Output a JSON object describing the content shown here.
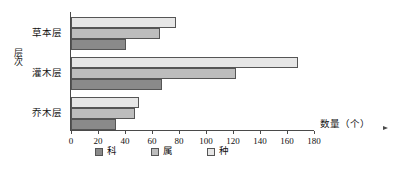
{
  "chart_data": {
    "type": "bar",
    "orientation": "horizontal",
    "title": "",
    "xlabel": "数量（个）",
    "ylabel": "层次",
    "xlim": [
      0,
      180
    ],
    "xticks": [
      0,
      20,
      40,
      60,
      80,
      100,
      120,
      140,
      160,
      180
    ],
    "grid": false,
    "legend_position": "bottom",
    "categories": [
      "乔木层",
      "灌木层",
      "草本层"
    ],
    "series": [
      {
        "name": "科",
        "color": "#8a8a8a",
        "values": [
          33,
          67,
          41
        ]
      },
      {
        "name": "属",
        "color": "#bdbdbd",
        "values": [
          47,
          122,
          66
        ]
      },
      {
        "name": "种",
        "color": "#e6e6e6",
        "values": [
          50,
          168,
          78
        ]
      }
    ]
  },
  "axis": {
    "y_title": "层次",
    "x_title": "数量（个）",
    "tick_labels": [
      "0",
      "20",
      "40",
      "60",
      "80",
      "100",
      "120",
      "140",
      "160",
      "180"
    ]
  },
  "categories": {
    "herb": "草本层",
    "shrub": "灌木层",
    "tree": "乔木层"
  },
  "legend": {
    "items": [
      {
        "label": "科"
      },
      {
        "label": "属"
      },
      {
        "label": "种"
      }
    ]
  },
  "bars": {
    "herb": {
      "zhong": "78",
      "shu": "66",
      "ke": "41"
    },
    "shrub": {
      "zhong": "168",
      "shu": "122",
      "ke": "67"
    },
    "tree": {
      "zhong": "50",
      "shu": "47",
      "ke": "33"
    }
  }
}
